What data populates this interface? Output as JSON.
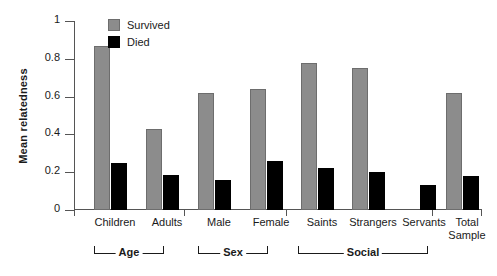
{
  "chart_data": {
    "type": "bar",
    "title": "",
    "xlabel": "",
    "ylabel": "Mean relatedness",
    "ylim": [
      0,
      1
    ],
    "ytick_labels": [
      "0",
      "0.2",
      "0.4",
      "0.6",
      "0.8",
      "1"
    ],
    "ytick_values": [
      0,
      0.2,
      0.4,
      0.6,
      0.8,
      1
    ],
    "grid": false,
    "legend_position": "top-left-inside",
    "categories": [
      "Children",
      "Adults",
      "Male",
      "Female",
      "Saints",
      "Strangers",
      "Servants",
      "Total\nSample"
    ],
    "series": [
      {
        "name": "Survived",
        "color": "#8c8c8c",
        "values": [
          0.87,
          0.43,
          0.62,
          0.64,
          0.78,
          0.75,
          null,
          0.62
        ]
      },
      {
        "name": "Died",
        "color": "#000000",
        "values": [
          0.25,
          0.185,
          0.16,
          0.26,
          0.22,
          0.2,
          0.13,
          0.18
        ]
      }
    ],
    "groups": [
      {
        "label": "Age",
        "categories": [
          "Children",
          "Adults"
        ]
      },
      {
        "label": "Sex",
        "categories": [
          "Male",
          "Female"
        ]
      },
      {
        "label": "Social",
        "categories": [
          "Saints",
          "Strangers",
          "Servants"
        ]
      }
    ]
  },
  "legend": {
    "items": [
      {
        "label": "Survived",
        "color": "#8c8c8c"
      },
      {
        "label": "Died",
        "color": "#000000"
      }
    ]
  },
  "axis": {
    "y_title": "Mean relatedness",
    "y_ticks": [
      "1",
      "0.8",
      "0.6",
      "0.4",
      "0.2",
      "0"
    ]
  },
  "categories": [
    {
      "label": "Children"
    },
    {
      "label": "Adults"
    },
    {
      "label": "Male"
    },
    {
      "label": "Female"
    },
    {
      "label": "Saints"
    },
    {
      "label": "Strangers"
    },
    {
      "label": "Servants"
    },
    {
      "label": "Total\nSample"
    }
  ],
  "groups": [
    {
      "label": "Age"
    },
    {
      "label": "Sex"
    },
    {
      "label": "Social"
    }
  ]
}
